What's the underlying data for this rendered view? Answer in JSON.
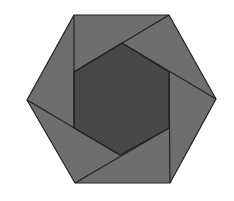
{
  "diagram": {
    "title": "",
    "background": "#ffffff",
    "outer_fill": "#6e6e6e",
    "inner_fill": "#484848",
    "stroke": "#222222",
    "outer_hexagon": [
      [
        74,
        15
      ],
      [
        169,
        15
      ],
      [
        216,
        99
      ],
      [
        170,
        183
      ],
      [
        75,
        183
      ],
      [
        27,
        100
      ]
    ],
    "inner_hexagon": [
      [
        122,
        43
      ],
      [
        169,
        72
      ],
      [
        169,
        128
      ],
      [
        120,
        155
      ],
      [
        74,
        128
      ],
      [
        74,
        72
      ]
    ],
    "segments": [
      [
        [
          74,
          15
        ],
        [
          74,
          128
        ]
      ],
      [
        [
          169,
          15
        ],
        [
          74,
          72
        ]
      ],
      [
        [
          216,
          99
        ],
        [
          122,
          43
        ]
      ],
      [
        [
          170,
          183
        ],
        [
          169,
          72
        ]
      ],
      [
        [
          75,
          183
        ],
        [
          169,
          128
        ]
      ],
      [
        [
          27,
          100
        ],
        [
          120,
          155
        ]
      ]
    ]
  }
}
